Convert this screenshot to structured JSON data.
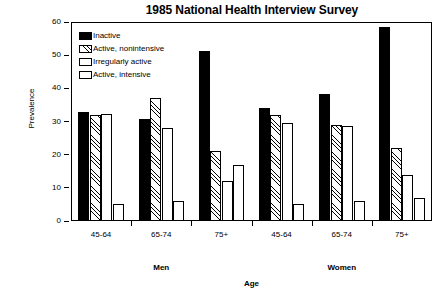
{
  "chart_data": {
    "type": "bar",
    "title": "1985 National Health Interview Survey",
    "xlabel": "Age",
    "ylabel": "Prevalence",
    "ylim": [
      0,
      60
    ],
    "yticks": [
      0,
      10,
      20,
      30,
      40,
      50,
      60
    ],
    "grid": false,
    "legend_position": "top-left",
    "panels": [
      "Men",
      "Women"
    ],
    "categories": [
      "45-64",
      "65-74",
      "75+",
      "45-64",
      "65-74",
      "75+"
    ],
    "group_panels": [
      "Men",
      "Men",
      "Men",
      "Women",
      "Women",
      "Women"
    ],
    "series": [
      {
        "name": "Inactive",
        "pattern": "solid",
        "values": [
          33.0,
          30.7,
          51.2,
          34.2,
          38.2,
          58.6
        ]
      },
      {
        "name": "Active, nonintensive",
        "pattern": "hatch",
        "values": [
          32.0,
          37.0,
          21.0,
          32.0,
          29.0,
          22.0
        ]
      },
      {
        "name": "Irregularly active",
        "pattern": "dots",
        "values": [
          32.3,
          28.0,
          12.0,
          29.6,
          28.6,
          14.0
        ]
      },
      {
        "name": "Active, intensive",
        "pattern": "open",
        "values": [
          5.0,
          6.0,
          17.0,
          5.0,
          6.0,
          7.0
        ]
      }
    ]
  }
}
